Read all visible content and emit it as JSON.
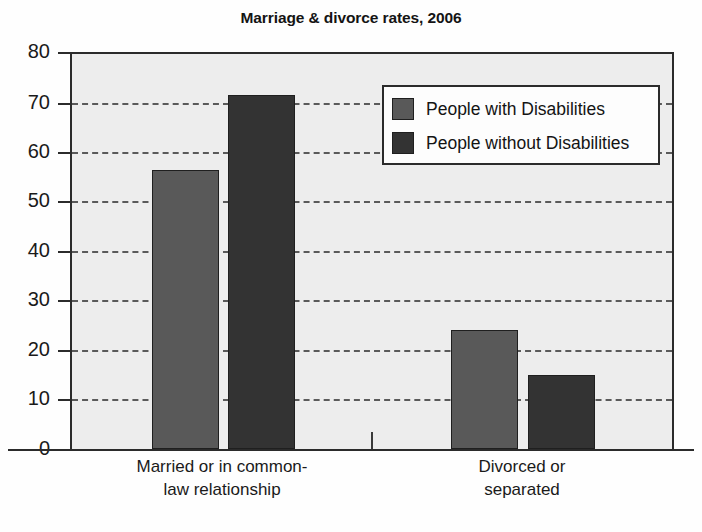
{
  "chart_data": {
    "type": "bar",
    "title": "Marriage & divorce rates, 2006",
    "xlabel": "",
    "ylabel": "",
    "ylim": [
      0,
      80
    ],
    "yticks": [
      0,
      10,
      20,
      30,
      40,
      50,
      60,
      70,
      80
    ],
    "ytick_labels": [
      "0",
      "10",
      "20",
      "30",
      "40",
      "50",
      "60",
      "70",
      "80"
    ],
    "grid": true,
    "grid_axis": "y",
    "grid_style": "dashed",
    "legend_position": "upper right",
    "categories": [
      "Married or in common-law relationship",
      "Divorced or separated"
    ],
    "category_lines": [
      [
        "Married or in common-",
        "law relationship"
      ],
      [
        "Divorced or",
        "separated"
      ]
    ],
    "series": [
      {
        "name": "People with Disabilities",
        "color": "#595959",
        "values": [
          56.2,
          24.0
        ]
      },
      {
        "name": "People without Disabilities",
        "color": "#333333",
        "values": [
          71.3,
          15.0
        ]
      }
    ],
    "colors": {
      "plot_background": "#ededed",
      "axis": "#2b2b2b",
      "gridline": "#5a5a5a",
      "series_1": "#595959",
      "series_2": "#333333",
      "text": "#1a1a1a"
    }
  }
}
